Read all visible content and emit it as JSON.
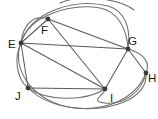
{
  "figure": {
    "kind": "undirected-graph-drawing",
    "width": 158,
    "height": 119,
    "background_color": "#ffffff",
    "edge_color": "#5a5a5a",
    "curved_edge_color": "#6e6e6e",
    "vertex_color": "#3a3a3a",
    "label_color": "#1a1a1a"
  },
  "vertices": [
    {
      "id": "E",
      "label": "E",
      "x": 21,
      "y": 43,
      "label_x": 8,
      "label_y": 48,
      "r": 2.4
    },
    {
      "id": "F",
      "label": "F",
      "x": 48,
      "y": 19,
      "label_x": 41,
      "label_y": 34,
      "r": 2.4
    },
    {
      "id": "G",
      "label": "G",
      "x": 128,
      "y": 49,
      "label_x": 128,
      "label_y": 45,
      "r": 2.4
    },
    {
      "id": "H",
      "label": "H",
      "x": 146,
      "y": 73,
      "label_x": 148,
      "label_y": 82,
      "r": 2.4
    },
    {
      "id": "I",
      "label": "I",
      "x": 105,
      "y": 89,
      "label_x": 110,
      "label_y": 102,
      "r": 2.4
    },
    {
      "id": "J",
      "label": "J",
      "x": 28,
      "y": 88,
      "label_x": 15,
      "label_y": 100,
      "r": 2.4
    }
  ],
  "straight_edges": [
    {
      "from": "E",
      "to": "F",
      "d": "M 21 43 L 48 19"
    },
    {
      "from": "E",
      "to": "G",
      "d": "M 21 43 L 128 49"
    },
    {
      "from": "E",
      "to": "I",
      "d": "M 21 43 L 105 89"
    },
    {
      "from": "E",
      "to": "J",
      "d": "M 21 43 L 28 88"
    },
    {
      "from": "F",
      "to": "G",
      "d": "M 48 19 L 128 49"
    },
    {
      "from": "F",
      "to": "I",
      "d": "M 48 19 L 105 89"
    },
    {
      "from": "G",
      "to": "I",
      "d": "M 128 49 L 105 89"
    },
    {
      "from": "G",
      "to": "H",
      "d": "M 128 49 L 146 73"
    },
    {
      "from": "J",
      "to": "I",
      "d": "M 28 88 L 105 89"
    }
  ],
  "curved_edges": [
    {
      "from": "E",
      "to": "F",
      "d": "M 21 43 C 23 24 34 14 48 19"
    },
    {
      "from": "E",
      "to": "G",
      "d": "M 21 43 C 28 16 70 3 100 8 C 117 11 127 28 128 49"
    },
    {
      "from": "E",
      "to": "G",
      "d": "M 21 43 C 31 11 75 -2 108 6 C 126 11 131 30 128 49"
    },
    {
      "from": "E",
      "to": "J",
      "d": "M 21 43 C 14 58 16 78 28 88"
    },
    {
      "from": "G",
      "to": "H",
      "d": "M 128 49 C 143 53 151 62 146 73"
    },
    {
      "from": "H",
      "to": "I",
      "d": "M 146 73 C 142 92 124 105 105 103 C 88 101 105 95 105 89"
    },
    {
      "from": "J",
      "to": "I",
      "d": "M 28 88 C 45 100 82 103 105 89"
    },
    {
      "from": "J",
      "to": "I",
      "d": "M 28 88 C 50 110 95 114 124 102 C 140 95 147 85 146 73"
    },
    {
      "from": "E",
      "to": "I",
      "d": "M 21 43 C 10 70 35 104 75 108 C 108 111 136 98 146 73"
    }
  ],
  "top_partial_arc": {
    "d": "M 60 3 C 80 -6 118 -2 134 10"
  }
}
